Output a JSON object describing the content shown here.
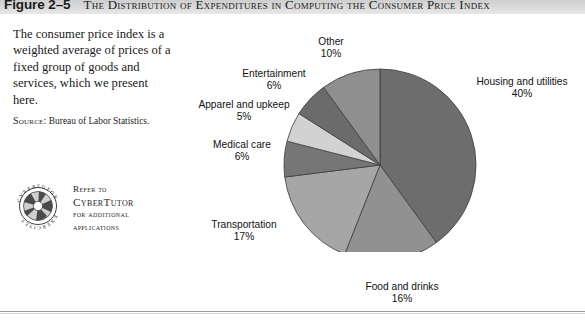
{
  "figure": {
    "number": "Figure 2–5",
    "title": "The Distribution of Expenditures in Computing the Consumer Price Index"
  },
  "caption": {
    "body": "The consumer price index is a weighted average of prices of a fixed group of goods and services, which we present here.",
    "source_label": "Source:",
    "source_text": "Bureau of Labor Statistics."
  },
  "cybertutor": {
    "badge_top_text": "CYBERTUTOR",
    "badge_bottom_text": "EXERCISES",
    "line1": "Refer to",
    "line2": "CyberTutor",
    "line3": "for additional",
    "line4": "applications"
  },
  "chart_data": {
    "type": "pie",
    "title": "The Distribution of Expenditures in Computing the Consumer Price Index",
    "categories": [
      "Housing and utilities",
      "Food and drinks",
      "Transportation",
      "Medical care",
      "Apparel and upkeep",
      "Entertainment",
      "Other"
    ],
    "values": [
      40,
      16,
      17,
      6,
      5,
      6,
      10
    ],
    "unit": "%",
    "labels": [
      "Housing and utilities\n40%",
      "Food and drinks\n16%",
      "Transportation\n17%",
      "Medical care\n6%",
      "Apparel and upkeep\n5%",
      "Entertainment\n6%",
      "Other\n10%"
    ],
    "colors": [
      "#6d6d6d",
      "#919191",
      "#a6a6a6",
      "#767676",
      "#d2d2d2",
      "#6b6b6b",
      "#8f8f8f"
    ],
    "legend": "none",
    "start_angle_deg": 0,
    "direction": "clockwise"
  },
  "slices": [
    {
      "name": "Housing and utilities",
      "label": "Housing and utilities",
      "pct": "40%",
      "value": 40,
      "color": "#6d6d6d"
    },
    {
      "name": "Food and drinks",
      "label": "Food and drinks",
      "pct": "16%",
      "value": 16,
      "color": "#919191"
    },
    {
      "name": "Transportation",
      "label": "Transportation",
      "pct": "17%",
      "value": 17,
      "color": "#a6a6a6"
    },
    {
      "name": "Medical care",
      "label": "Medical care",
      "pct": "6%",
      "value": 6,
      "color": "#767676"
    },
    {
      "name": "Apparel and upkeep",
      "label": "Apparel and upkeep",
      "pct": "5%",
      "value": 5,
      "color": "#d2d2d2"
    },
    {
      "name": "Entertainment",
      "label": "Entertainment",
      "pct": "6%",
      "value": 6,
      "color": "#6b6b6b"
    },
    {
      "name": "Other",
      "label": "Other",
      "pct": "10%",
      "value": 10,
      "color": "#8f8f8f"
    }
  ]
}
